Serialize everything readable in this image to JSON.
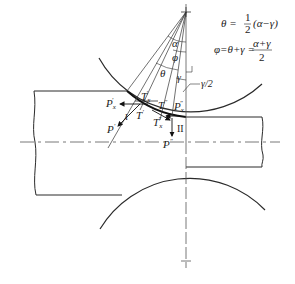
{
  "diagram": {
    "type": "rolling-mill force diagram",
    "colors": {
      "line": "#2a2a2a",
      "thin": "#555555",
      "background": "#ffffff"
    },
    "equations": {
      "theta_lhs": "θ =",
      "theta_frac_num": "1",
      "theta_frac_den": "2",
      "theta_rhs": "(α−γ)",
      "phi_lhs": "φ=θ+γ =",
      "phi_frac_num": "α+γ",
      "phi_frac_den": "2"
    },
    "angle_labels": {
      "alpha": "α",
      "phi": "φ",
      "theta": "θ",
      "gamma": "γ",
      "gamma_half": "γ/2"
    },
    "force_labels": {
      "Px_prime": {
        "base": "P",
        "sub": "x",
        "sup": "′"
      },
      "Tx_prime": {
        "base": "T",
        "sub": "x",
        "sup": "′"
      },
      "T_prime": {
        "base": "T",
        "sup": "′"
      },
      "P_prime": {
        "base": "P",
        "sup": "′"
      },
      "T_dprime": {
        "base": "T",
        "sup": "″"
      },
      "Px_dprime": {
        "base": "P",
        "sub": "x",
        "sup": "″"
      },
      "Tx_dprime": {
        "base": "T",
        "sub": "x",
        "sup": "″"
      },
      "P_dprime": {
        "base": "P",
        "sup": "″"
      }
    },
    "zone_labels": {
      "zone_I": "I",
      "zone_II": "II"
    }
  }
}
